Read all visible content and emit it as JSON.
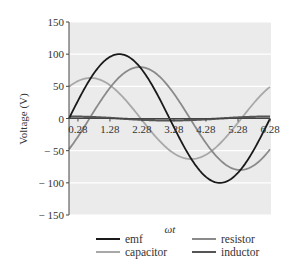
{
  "chart_data": {
    "type": "line",
    "title": "",
    "xlabel": "ωt",
    "ylabel": "Voltage (V)",
    "xlim": [
      0,
      6.28
    ],
    "ylim": [
      -150,
      150
    ],
    "yticks": [
      150,
      100,
      50,
      0,
      -50,
      -100,
      -150
    ],
    "ytick_labels": [
      "150",
      "100",
      "50",
      "0",
      "− 50",
      "− 100",
      "− 150"
    ],
    "xticks": [
      0.28,
      1.28,
      2.28,
      3.28,
      4.28,
      5.28,
      6.28
    ],
    "xtick_labels": [
      "0.28",
      "1.28",
      "2.28",
      "3.28",
      "4.28",
      "5.28",
      "6.28"
    ],
    "grid": true,
    "legend_position": "bottom",
    "series": [
      {
        "name": "emf",
        "color": "#1a1a1a",
        "amplitude": 100,
        "phase": 0,
        "x": [
          0,
          0.5,
          1.0,
          1.57,
          2.0,
          2.5,
          3.14,
          3.5,
          4.0,
          4.71,
          5.0,
          5.5,
          6.28
        ],
        "values": [
          0,
          48,
          84,
          100,
          91,
          60,
          0,
          -35,
          -76,
          -100,
          -96,
          -71,
          0
        ]
      },
      {
        "name": "resistor",
        "color": "#8a8a8a",
        "amplitude": 80,
        "phase": -0.64,
        "x": [
          0,
          0.5,
          1.0,
          1.57,
          2.21,
          2.5,
          3.14,
          3.78,
          4.5,
          5.35,
          5.8,
          6.28
        ],
        "values": [
          -48,
          -11,
          29,
          61,
          80,
          77,
          48,
          0,
          -55,
          -80,
          -71,
          -48
        ]
      },
      {
        "name": "capacitor",
        "color": "#a8a8a8",
        "amplitude": 63,
        "phase": 0.9,
        "x": [
          0,
          0.67,
          1.0,
          1.57,
          2.24,
          3.0,
          3.81,
          4.5,
          5.38,
          6.0,
          6.28
        ],
        "values": [
          49,
          63,
          61,
          39,
          0,
          -46,
          -63,
          -56,
          0,
          34,
          49
        ]
      },
      {
        "name": "inductor",
        "color": "#555555",
        "amplitude": 3,
        "phase": 0,
        "x": [
          0,
          1.57,
          3.14,
          4.71,
          6.28
        ],
        "values": [
          3,
          0,
          -3,
          0,
          3
        ]
      }
    ]
  },
  "legend": {
    "items": [
      {
        "label": "emf",
        "color": "#1a1a1a"
      },
      {
        "label": "resistor",
        "color": "#8a8a8a"
      },
      {
        "label": "capacitor",
        "color": "#a8a8a8"
      },
      {
        "label": "inductor",
        "color": "#555555"
      }
    ]
  }
}
